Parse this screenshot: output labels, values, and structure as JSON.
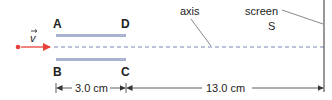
{
  "diagram": {
    "labels": {
      "plate_top_left": "A",
      "plate_top_right": "D",
      "plate_bottom_left": "B",
      "plate_bottom_right": "C",
      "velocity": "v",
      "axis": "axis",
      "screen": "screen",
      "screen_point": "S"
    },
    "dimensions": {
      "plate_length": "3.0 cm",
      "plate_to_screen": "13.0 cm"
    },
    "colors": {
      "particle": "#e8413a",
      "plates": "#a9b3cf",
      "axis_dashes": "#7a86b0",
      "lines": "#333333"
    }
  }
}
